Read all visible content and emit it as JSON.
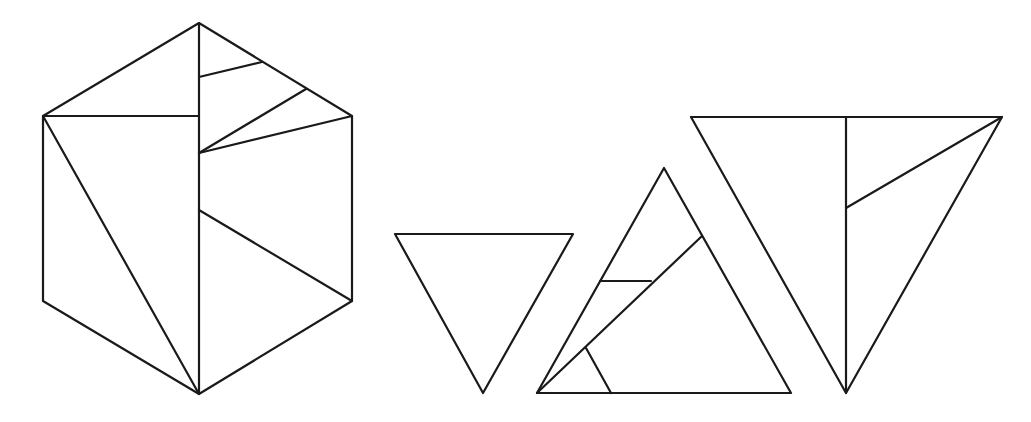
{
  "diagram": {
    "stroke_color": "#1a1a1a",
    "background": "#ffffff",
    "shapes": [
      {
        "id": "hexagon",
        "outline": [
          [
            199,
            23
          ],
          [
            352,
            116
          ],
          [
            352,
            301
          ],
          [
            199,
            394
          ],
          [
            43,
            301
          ],
          [
            43,
            116
          ]
        ],
        "cuts": [
          [
            [
              199,
              23
            ],
            [
              199,
              394
            ]
          ],
          [
            [
              43,
              116
            ],
            [
              199,
              116
            ]
          ],
          [
            [
              43,
              116
            ],
            [
              199,
              394
            ]
          ],
          [
            [
              199,
              77
            ],
            [
              262,
              62
            ]
          ],
          [
            [
              199,
              153
            ],
            [
              306,
              89
            ]
          ],
          [
            [
              199,
              153
            ],
            [
              352,
              116
            ]
          ],
          [
            [
              199,
              210
            ],
            [
              352,
              301
            ]
          ]
        ]
      },
      {
        "id": "small-triangle",
        "outline": [
          [
            395,
            234
          ],
          [
            573,
            234
          ],
          [
            483,
            393
          ]
        ],
        "cuts": []
      },
      {
        "id": "medium-triangle",
        "outline": [
          [
            664,
            168
          ],
          [
            791,
            393
          ],
          [
            537,
            393
          ]
        ],
        "cuts": [
          [
            [
              537,
              393
            ],
            [
              702,
              236
            ]
          ],
          [
            [
              600,
              281
            ],
            [
              651,
              281
            ]
          ],
          [
            [
              586,
              348
            ],
            [
              611,
              393
            ]
          ]
        ]
      },
      {
        "id": "large-triangle",
        "outline": [
          [
            691,
            117
          ],
          [
            1002,
            117
          ],
          [
            846,
            393
          ]
        ],
        "cuts": [
          [
            [
              846,
              117
            ],
            [
              846,
              393
            ]
          ],
          [
            [
              846,
              208
            ],
            [
              1002,
              117
            ]
          ]
        ]
      }
    ]
  }
}
